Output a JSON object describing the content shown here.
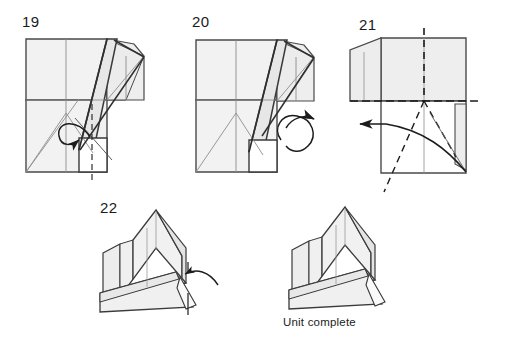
{
  "document": {
    "type": "origami-instruction-diagram",
    "background_color": "#ffffff",
    "line_color": "#3a3a3a",
    "paper_fill_light": "#f0f0f0",
    "paper_fill_mid": "#e6e6e6",
    "paper_fill_shadow": "#dcdcdc"
  },
  "steps": [
    {
      "id": "step-19",
      "number": "19",
      "arrows": [
        "fold-over-curved-arrow"
      ],
      "lines": [
        "valley-fold-dashed-vertical"
      ]
    },
    {
      "id": "step-20",
      "number": "20",
      "arrows": [
        "turn-over-loop-arrow"
      ],
      "lines": []
    },
    {
      "id": "step-21",
      "number": "21",
      "arrows": [
        "fold-left-curved-arrow"
      ],
      "lines": [
        "valley-fold-dashed-vertical",
        "fold-dash-dot-horizontal",
        "mountain-fold-dashed-diagonal"
      ]
    },
    {
      "id": "step-22",
      "number": "22",
      "arrows": [
        "tuck-left-curved-arrow"
      ],
      "lines": [
        "axis-dash-dot-vertical"
      ]
    }
  ],
  "result": {
    "id": "finished-unit",
    "caption": "Unit complete"
  }
}
